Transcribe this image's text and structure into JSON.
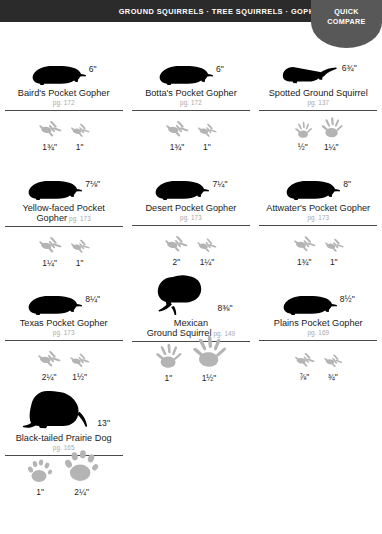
{
  "header": {
    "title": "GROUND SQUIRRELS · TREE SQUIRRELS · GOPHERS",
    "tab_line1": "QUICK",
    "tab_line2": "COMPARE",
    "bar_color": "#2b2b2b",
    "tab_color": "#585858"
  },
  "entries": [
    {
      "name": "Baird's Pocket Gopher",
      "name_line2": "",
      "page": "pg. 172",
      "page_inline": false,
      "body_size": "6\"",
      "silhouette": "gopher",
      "track_style": "gopher",
      "tracks": [
        {
          "label": "1¾\"",
          "scale": 1.0
        },
        {
          "label": "1\"",
          "scale": 0.86
        }
      ]
    },
    {
      "name": "Botta's Pocket Gopher",
      "name_line2": "",
      "page": "pg. 172",
      "page_inline": false,
      "body_size": "6\"",
      "silhouette": "gopher",
      "track_style": "gopher",
      "tracks": [
        {
          "label": "1¾\"",
          "scale": 1.0
        },
        {
          "label": "1\"",
          "scale": 0.86
        }
      ]
    },
    {
      "name": "Spotted Ground Squirrel",
      "name_line2": "",
      "page": "pg. 137",
      "page_inline": false,
      "body_size": "6¾\"",
      "silhouette": "squirrel",
      "track_style": "squirrel",
      "tracks": [
        {
          "label": "½\"",
          "scale": 0.78
        },
        {
          "label": "1¼\"",
          "scale": 0.96
        }
      ]
    },
    {
      "name": "Yellow-faced Pocket",
      "name_line2": "Gopher",
      "page": "pg. 173",
      "page_inline": true,
      "body_size": "7⅛\"",
      "silhouette": "gopher",
      "track_style": "gopher",
      "tracks": [
        {
          "label": "1¼\"",
          "scale": 1.0
        },
        {
          "label": "1\"",
          "scale": 0.86
        }
      ]
    },
    {
      "name": "Desert Pocket Gopher",
      "name_line2": "",
      "page": "pg. 173",
      "page_inline": false,
      "body_size": "7¼\"",
      "silhouette": "gopher",
      "track_style": "gopher",
      "tracks": [
        {
          "label": "2\"",
          "scale": 1.0
        },
        {
          "label": "1¼\"",
          "scale": 0.88
        }
      ]
    },
    {
      "name": "Attwater's Pocket Gopher",
      "name_line2": "",
      "page": "pg. 173",
      "page_inline": false,
      "body_size": "8\"",
      "silhouette": "gopher",
      "track_style": "gopher",
      "tracks": [
        {
          "label": "1¾\"",
          "scale": 0.98
        },
        {
          "label": "1\"",
          "scale": 0.86
        }
      ]
    },
    {
      "name": "Texas Pocket Gopher",
      "name_line2": "",
      "page": "pg. 173",
      "page_inline": false,
      "body_size": "8¼\"",
      "silhouette": "gopher",
      "track_style": "gopher",
      "tracks": [
        {
          "label": "2¼\"",
          "scale": 1.0
        },
        {
          "label": "1½\"",
          "scale": 0.88
        }
      ]
    },
    {
      "name": "Mexican",
      "name_line2": "Ground Squirrel",
      "page": "pg. 149",
      "page_inline": true,
      "body_size": "8⅜\"",
      "silhouette": "squirrel-big",
      "track_style": "squirrel",
      "tracks": [
        {
          "label": "1\"",
          "scale": 1.15
        },
        {
          "label": "1½\"",
          "scale": 1.5
        }
      ]
    },
    {
      "name": "Plains Pocket Gopher",
      "name_line2": "",
      "page": "pg. 169",
      "page_inline": false,
      "body_size": "8½\"",
      "silhouette": "gopher",
      "track_style": "gopher",
      "tracks": [
        {
          "label": "⅞\"",
          "scale": 0.9
        },
        {
          "label": "¾\"",
          "scale": 0.84
        }
      ]
    },
    {
      "name": "Black-tailed Prairie Dog",
      "name_line2": "",
      "page": "pg. 165",
      "page_inline": false,
      "body_size": "13\"",
      "silhouette": "prairiedog",
      "track_style": "prairiedog",
      "tracks": [
        {
          "label": "1\"",
          "scale": 1.0
        },
        {
          "label": "2¼\"",
          "scale": 1.35
        }
      ]
    }
  ]
}
